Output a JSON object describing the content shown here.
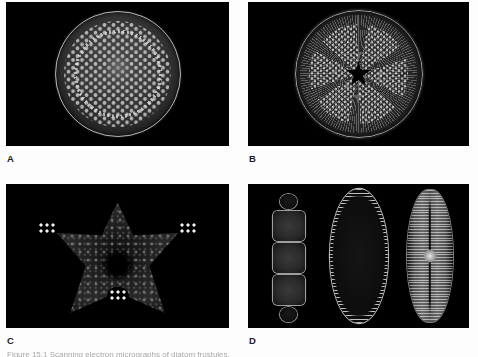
{
  "figure": {
    "background_color": "#fdfdfd",
    "panel_background_color": "#000000",
    "label_color": "#1b1b1b",
    "caption_partial": "Figure 15.1  Scanning electron micrographs of diatom frustules."
  },
  "panels": [
    {
      "id": "A",
      "label": "A",
      "name": "centric-diatom-disc",
      "description": "Circular centric diatom valve with hexagonally packed areolae and a marginal ring of radial chambers"
    },
    {
      "id": "B",
      "label": "B",
      "name": "sectored-centric-diatom",
      "description": "Circular centric diatom valve with a dark star-shaped central area and radiating sectors of dotted striae"
    },
    {
      "id": "C",
      "label": "C",
      "name": "triangular-diatom",
      "description": "Triangular diatom valve with concave sides, three bright granule clusters at the corners and a dark centre"
    },
    {
      "id": "D",
      "label": "D",
      "name": "pennate-diatom-group",
      "description": "Three pennate diatoms: a girdle-view chain of three cells, a lanceolate striated valve and a raphe-bearing valve",
      "specimens": [
        {
          "name": "girdle-view-chain",
          "cells": 3
        },
        {
          "name": "lanceolate-striated-valve"
        },
        {
          "name": "raphe-valve-with-central-nodule"
        }
      ]
    }
  ]
}
